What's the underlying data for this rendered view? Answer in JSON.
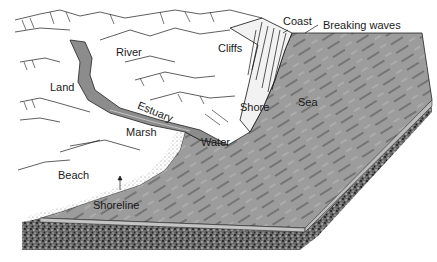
{
  "figure": {
    "type": "coastal landform block diagram",
    "colors": {
      "water": "#9a9a9a",
      "water_light": "#b8b8b8",
      "water_lines": "#3a3a3a",
      "land": "#ffffff",
      "ink": "#1a1a1a",
      "gravel": "#4a4a4a"
    },
    "labels": {
      "coast": "Coast",
      "breaking_waves": "Breaking waves",
      "river": "River",
      "cliffs": "Cliffs",
      "land": "Land",
      "estuary": "Estuary",
      "shore": "Shore",
      "sea": "Sea",
      "marsh": "Marsh",
      "water": "Water",
      "beach": "Beach",
      "shoreline": "Shoreline"
    }
  }
}
